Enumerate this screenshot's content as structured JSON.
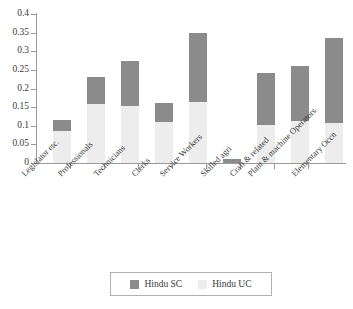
{
  "chart_data": {
    "type": "bar",
    "stacked": true,
    "title": "",
    "subtitle": "",
    "xlabel": "",
    "ylabel": "",
    "ylim": [
      0,
      0.4
    ],
    "ytick_labels": [
      "0.4",
      "0.35",
      "0.3",
      "0.25",
      "0.2",
      "0.15",
      "0.1",
      "0.05",
      "0"
    ],
    "ytick_values": [
      0.4,
      0.35,
      0.3,
      0.25,
      0.2,
      0.15,
      0.1,
      0.05,
      0
    ],
    "grid": false,
    "legend_position": "bottom",
    "categories": [
      "Legislator etc.",
      "Professionals",
      "Technicians",
      "Clerks",
      "Service Workers",
      "Skilled agri",
      "Craft & related",
      "Plant & machine Operators",
      "Elementary Occn"
    ],
    "series": [
      {
        "name": "Hindu UC",
        "color": "#ededed",
        "values": [
          0.086,
          0.158,
          0.153,
          0.11,
          0.164,
          0.0,
          0.102,
          0.113,
          0.107
        ]
      },
      {
        "name": "Hindu SC",
        "color": "#8b8b8b",
        "values": [
          0.029,
          0.073,
          0.121,
          0.051,
          0.186,
          0.012,
          0.14,
          0.147,
          0.228
        ]
      }
    ],
    "totals": [
      0.115,
      0.231,
      0.274,
      0.161,
      0.35,
      0.012,
      0.242,
      0.26,
      0.335
    ]
  },
  "legend": {
    "entries": [
      {
        "label": "Hindu SC",
        "color": "#8b8b8b"
      },
      {
        "label": "Hindu UC",
        "color": "#ededed"
      }
    ]
  },
  "colors": {
    "sc": "#8b8b8b",
    "uc": "#ededed",
    "axis": "#9a9a9a",
    "text": "#3a3a3a",
    "background": "#ffffff"
  }
}
